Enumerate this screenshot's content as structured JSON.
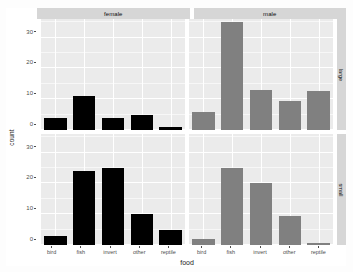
{
  "chart_data": {
    "type": "bar",
    "title": "",
    "xlabel": "food",
    "ylabel": "count",
    "categories": [
      "bird",
      "fish",
      "invert",
      "other",
      "reptile"
    ],
    "ylim": [
      0,
      36
    ],
    "y_ticks": [
      0,
      10,
      20,
      30
    ],
    "grid": true,
    "legend": "none",
    "facet_columns": [
      "female",
      "male"
    ],
    "facet_rows": [
      "large",
      "small"
    ],
    "panels": [
      {
        "row": "large",
        "column": "female",
        "color": "#000000",
        "values": [
          4,
          11,
          4,
          5,
          1
        ]
      },
      {
        "row": "large",
        "column": "male",
        "color": "#808080",
        "values": [
          6,
          35,
          13,
          9.5,
          12.5
        ]
      },
      {
        "row": "small",
        "column": "female",
        "color": "#000000",
        "values": [
          3,
          24,
          25,
          10,
          5
        ]
      },
      {
        "row": "small",
        "column": "male",
        "color": "#808080",
        "values": [
          2,
          25,
          20,
          9.5,
          0.5
        ]
      }
    ]
  },
  "axis": {
    "y_title": "count",
    "x_title": "food",
    "y_tick_labels": [
      "30",
      "20",
      "10",
      "0"
    ],
    "x_tick_labels": [
      "bird",
      "fish",
      "invert",
      "other",
      "reptile"
    ]
  },
  "strips": {
    "top": [
      "female",
      "male"
    ],
    "right": [
      "large",
      "small"
    ]
  },
  "style": {
    "panel_background": "#ebebeb",
    "strip_background": "#d6d6d6",
    "gridline_color": "#ffffff",
    "female_fill": "#000000",
    "male_fill": "#808080"
  }
}
